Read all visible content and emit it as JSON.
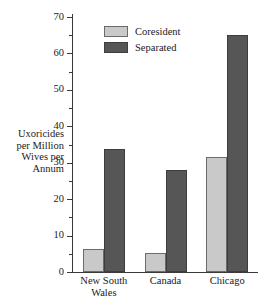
{
  "chart_data": {
    "type": "bar",
    "title": "",
    "xlabel": "",
    "ylabel": "Uxoricides per Million Wives per Annum",
    "ylabel_lines": [
      "Uxoricides",
      "per Million",
      "Wives per",
      "Annum"
    ],
    "categories": [
      "New South Wales",
      "Canada",
      "Chicago"
    ],
    "category_lines": [
      [
        "New South",
        "Wales"
      ],
      [
        "Canada"
      ],
      [
        "Chicago"
      ]
    ],
    "series": [
      {
        "name": "Coresident",
        "color": "#c9c9c9",
        "values": [
          6.3,
          5.2,
          31.5
        ]
      },
      {
        "name": "Separated",
        "color": "#565656",
        "values": [
          33.7,
          28.0,
          65.0
        ]
      }
    ],
    "ylim": [
      0,
      70
    ],
    "y_major_ticks": [
      0,
      10,
      20,
      30,
      40,
      50,
      60,
      70
    ],
    "y_minor_ticks": [
      5,
      15,
      25,
      35,
      45,
      55,
      65
    ],
    "y_tick_labels": [
      "0",
      "10",
      "20",
      "30",
      "40",
      "50",
      "60",
      "70"
    ],
    "grid": false,
    "legend_position": "top-center",
    "legend_entries": [
      "Coresident",
      "Separated"
    ],
    "bar_outline_color": "#555555",
    "axis_color": "#3a3a3a",
    "background_color": "#ffffff"
  }
}
